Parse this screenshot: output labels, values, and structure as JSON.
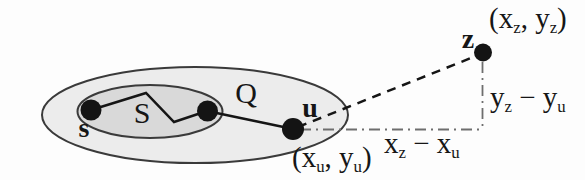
{
  "figure": {
    "type": "geometric-diagram",
    "colors": {
      "outer_ellipse_fill": "#ececec",
      "inner_ellipse_fill": "#d9d9d9",
      "ellipse_outline": "#3a3a3a",
      "solid_line": "#151515",
      "dot_fill": "#141414",
      "dashdot_line": "#6e6e6e",
      "text": "#161616",
      "background": "#fdfdfd"
    },
    "sets": {
      "outer": "Q",
      "inner": "S"
    },
    "points": {
      "s": "s",
      "u": "u",
      "z": "z"
    },
    "coord_labels": {
      "z": {
        "pre": "(x",
        "sub1": "z",
        "mid": ", y",
        "sub2": "z",
        "post": ")"
      },
      "u": {
        "pre": "(x",
        "sub1": "u",
        "mid": ", y",
        "sub2": "u",
        "post": ")"
      }
    },
    "offsets": {
      "dy": {
        "base1": "y",
        "sub1": "z",
        "minus": " − ",
        "base2": "y",
        "sub2": "u"
      },
      "dx": {
        "base1": "x",
        "sub1": "z",
        "minus": " − ",
        "base2": "x",
        "sub2": "u"
      }
    }
  }
}
